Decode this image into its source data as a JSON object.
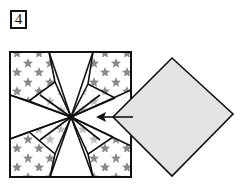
{
  "step": {
    "number": "4"
  },
  "diagram": {
    "colors": {
      "outline": "#111111",
      "paper_pattern_star": "#8a8a8a",
      "flap_fill": "#e3e3e3",
      "plain_paper": "#ffffff"
    },
    "arrow": {
      "direction": "left",
      "label": ""
    }
  }
}
